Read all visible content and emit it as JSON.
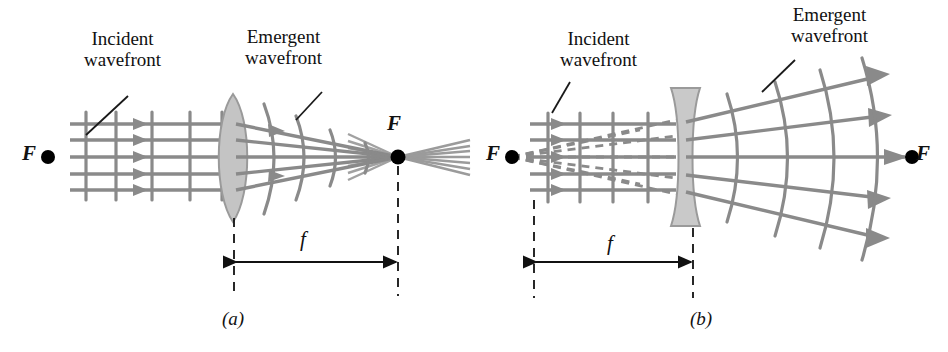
{
  "figure": {
    "colors": {
      "ray": "#8a8a8a",
      "wavefront": "#8a8a8a",
      "virtual_ray_dashed": "#8a8a8a",
      "lens_fill": "#c9c9c9",
      "lens_stroke": "#9a9a9a",
      "text": "#111111",
      "focal_dot": "#000000",
      "leader_line": "#1a1a1a",
      "dimension_line": "#111111",
      "background": "#ffffff"
    }
  },
  "panels": [
    {
      "id": "a",
      "caption": "(a)",
      "lens_type": "converging-biconvex",
      "incident_label": "Incident\nwavefront",
      "emergent_label": "Emergent\nwavefront",
      "focal_point_left_label": "F",
      "focal_point_right_label": "F",
      "focal_length_label": "f",
      "incident_rays": 5,
      "incident_wavefronts": 5,
      "emergent_wavefronts": 4,
      "description": "Plane incident wavefronts converge after a biconvex lens to the focal point F, then diverge beyond it."
    },
    {
      "id": "b",
      "caption": "(b)",
      "lens_type": "diverging-biconcave",
      "incident_label": "Incident\nwavefront",
      "emergent_label": "Emergent\nwavefront",
      "focal_point_left_label": "F",
      "focal_point_right_label": "F",
      "focal_length_label": "f",
      "incident_rays": 5,
      "incident_wavefronts": 4,
      "emergent_wavefronts": 4,
      "virtual_rays": 5,
      "description": "Plane incident wavefronts diverge after a biconcave lens, appearing to come from the virtual focal point F on the left."
    }
  ]
}
